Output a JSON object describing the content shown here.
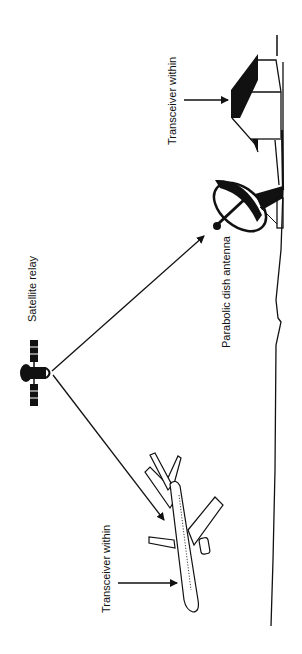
{
  "diagram": {
    "type": "satellite-communication",
    "orientation": "rotated-90-ccw",
    "labels": {
      "building_transceiver": "Transceiver within",
      "satellite": "Satellite relay",
      "dish": "Parabolic dish antenna",
      "aircraft_transceiver": "Transceiver within"
    },
    "nodes": [
      {
        "id": "building",
        "label": "Transceiver within"
      },
      {
        "id": "dish",
        "label": "Parabolic dish antenna"
      },
      {
        "id": "satellite",
        "label": "Satellite relay"
      },
      {
        "id": "aircraft",
        "label": "Transceiver within"
      }
    ],
    "edges": [
      {
        "from": "satellite",
        "to": "dish"
      },
      {
        "from": "satellite",
        "to": "aircraft"
      }
    ],
    "colors": {
      "ink": "#111111",
      "background": "#ffffff"
    }
  }
}
